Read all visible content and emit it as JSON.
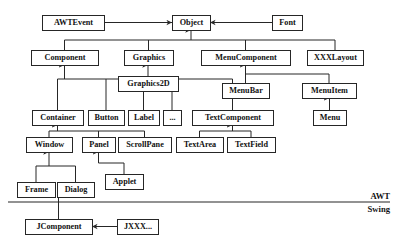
{
  "diagram": {
    "type": "class-hierarchy",
    "width": 396,
    "height": 247,
    "background_color": "#ffffff",
    "line_color": "#262626",
    "text_color": "#111111",
    "nodes": [
      {
        "id": "awtevent",
        "label": "AWTEvent",
        "x": 42,
        "y": 15,
        "w": 62,
        "h": 15,
        "font_size": 8.2
      },
      {
        "id": "object",
        "label": "Object",
        "x": 172,
        "y": 15,
        "w": 38,
        "h": 15,
        "font_size": 8.2
      },
      {
        "id": "font",
        "label": "Font",
        "x": 272,
        "y": 15,
        "w": 30,
        "h": 15,
        "font_size": 8.2
      },
      {
        "id": "component",
        "label": "Component",
        "x": 31,
        "y": 50,
        "w": 67,
        "h": 15,
        "font_size": 8.2
      },
      {
        "id": "graphics",
        "label": "Graphics",
        "x": 124,
        "y": 50,
        "w": 49,
        "h": 15,
        "font_size": 8.2
      },
      {
        "id": "menucomponent",
        "label": "MenuComponent",
        "x": 201,
        "y": 50,
        "w": 89,
        "h": 15,
        "font_size": 8.2
      },
      {
        "id": "xxxlayout",
        "label": "XXXLayout",
        "x": 307,
        "y": 50,
        "w": 56,
        "h": 15,
        "font_size": 8.2
      },
      {
        "id": "graphics2d",
        "label": "Graphics2D",
        "x": 118,
        "y": 76,
        "w": 60,
        "h": 15,
        "font_size": 8.2
      },
      {
        "id": "menubar",
        "label": "MenuBar",
        "x": 222,
        "y": 83,
        "w": 47,
        "h": 15,
        "font_size": 8.2
      },
      {
        "id": "menuitem",
        "label": "MenuItem",
        "x": 302,
        "y": 83,
        "w": 54,
        "h": 15,
        "font_size": 8.2
      },
      {
        "id": "container",
        "label": "Container",
        "x": 32,
        "y": 110,
        "w": 51,
        "h": 15,
        "font_size": 8.2
      },
      {
        "id": "button",
        "label": "Button",
        "x": 88,
        "y": 110,
        "w": 36,
        "h": 15,
        "font_size": 8.2
      },
      {
        "id": "label",
        "label": "Label",
        "x": 128,
        "y": 110,
        "w": 31,
        "h": 15,
        "font_size": 8.2
      },
      {
        "id": "ellipsis",
        "label": "...",
        "x": 163,
        "y": 110,
        "w": 18,
        "h": 15,
        "font_size": 8.2
      },
      {
        "id": "textcomponent",
        "label": "TextComponent",
        "x": 192,
        "y": 110,
        "w": 81,
        "h": 15,
        "font_size": 8.2
      },
      {
        "id": "menu",
        "label": "Menu",
        "x": 313,
        "y": 110,
        "w": 33,
        "h": 15,
        "font_size": 8.2
      },
      {
        "id": "window",
        "label": "Window",
        "x": 26,
        "y": 137,
        "w": 46,
        "h": 15,
        "font_size": 8.2
      },
      {
        "id": "panel",
        "label": "Panel",
        "x": 82,
        "y": 137,
        "w": 33,
        "h": 15,
        "font_size": 8.2
      },
      {
        "id": "scrollpane",
        "label": "ScrollPane",
        "x": 118,
        "y": 137,
        "w": 53,
        "h": 15,
        "font_size": 8.2
      },
      {
        "id": "textarea",
        "label": "TextArea",
        "x": 176,
        "y": 137,
        "w": 47,
        "h": 15,
        "font_size": 8.2
      },
      {
        "id": "textfield",
        "label": "TextField",
        "x": 227,
        "y": 137,
        "w": 48,
        "h": 15,
        "font_size": 8.2
      },
      {
        "id": "applet",
        "label": "Applet",
        "x": 105,
        "y": 174,
        "w": 38,
        "h": 15,
        "font_size": 8.2
      },
      {
        "id": "frame",
        "label": "Frame",
        "x": 17,
        "y": 182,
        "w": 38,
        "h": 15,
        "font_size": 8.2
      },
      {
        "id": "dialog",
        "label": "Dialog",
        "x": 57,
        "y": 182,
        "w": 37,
        "h": 15,
        "font_size": 8.2
      },
      {
        "id": "jcomponent",
        "label": "JComponent",
        "x": 25,
        "y": 219,
        "w": 67,
        "h": 15,
        "font_size": 8.2
      },
      {
        "id": "jxxx",
        "label": "JXXX...",
        "x": 117,
        "y": 219,
        "w": 41,
        "h": 15,
        "font_size": 8.2
      }
    ],
    "edges": [
      {
        "id": "e-awtevent-object",
        "from": "awtevent",
        "to": "object",
        "kind": "horizontal-arrow"
      },
      {
        "id": "e-font-object",
        "from": "font",
        "to": "object",
        "kind": "horizontal-arrow"
      },
      {
        "id": "e-jxxx-jcomponent",
        "from": "jxxx",
        "to": "jcomponent",
        "kind": "horizontal-arrow"
      },
      {
        "id": "e-component-object",
        "from": "component",
        "to": "object",
        "kind": "bus-up"
      },
      {
        "id": "e-graphics-object",
        "from": "graphics",
        "to": "object",
        "kind": "bus-up"
      },
      {
        "id": "e-menucomponent-object",
        "from": "menucomponent",
        "to": "object",
        "kind": "bus-up"
      },
      {
        "id": "e-xxxlayout-object",
        "from": "xxxlayout",
        "to": "object",
        "kind": "bus-up"
      },
      {
        "id": "e-graphics2d-graphics",
        "from": "graphics2d",
        "to": "graphics",
        "kind": "vertical-arrow"
      },
      {
        "id": "e-menubar-menucomponent",
        "from": "menubar",
        "to": "menucomponent",
        "kind": "bus-up"
      },
      {
        "id": "e-menuitem-menucomponent",
        "from": "menuitem",
        "to": "menucomponent",
        "kind": "bus-up"
      },
      {
        "id": "e-menu-menuitem",
        "from": "menu",
        "to": "menuitem",
        "kind": "vertical-arrow"
      },
      {
        "id": "e-container-component",
        "from": "container",
        "to": "component",
        "kind": "bus-up"
      },
      {
        "id": "e-button-component",
        "from": "button",
        "to": "component",
        "kind": "bus-up"
      },
      {
        "id": "e-label-component",
        "from": "label",
        "to": "component",
        "kind": "bus-up"
      },
      {
        "id": "e-ellipsis-component",
        "from": "ellipsis",
        "to": "component",
        "kind": "bus-up"
      },
      {
        "id": "e-textcomponent-component",
        "from": "textcomponent",
        "to": "component",
        "kind": "bus-up"
      },
      {
        "id": "e-window-container",
        "from": "window",
        "to": "container",
        "kind": "bus-up"
      },
      {
        "id": "e-panel-container",
        "from": "panel",
        "to": "container",
        "kind": "bus-up"
      },
      {
        "id": "e-scrollpane-container",
        "from": "scrollpane",
        "to": "container",
        "kind": "bus-up"
      },
      {
        "id": "e-textarea-textcomponent",
        "from": "textarea",
        "to": "textcomponent",
        "kind": "bus-up"
      },
      {
        "id": "e-textfield-textcomponent",
        "from": "textfield",
        "to": "textcomponent",
        "kind": "bus-up"
      },
      {
        "id": "e-frame-window",
        "from": "frame",
        "to": "window",
        "kind": "bus-up"
      },
      {
        "id": "e-dialog-window",
        "from": "dialog",
        "to": "window",
        "kind": "bus-up"
      },
      {
        "id": "e-applet-panel",
        "from": "applet",
        "to": "panel",
        "kind": "bus-up"
      },
      {
        "id": "e-jcomponent-dialog",
        "from": "jcomponent",
        "to": "dialog",
        "kind": "plain-vertical"
      }
    ],
    "divider": {
      "id": "awt-swing-divider",
      "x1": 8,
      "x2": 390,
      "y": 202
    },
    "layer_labels": [
      {
        "id": "awt-label",
        "label": "AWT",
        "x": 390,
        "y": 199,
        "font_size": 8.6
      },
      {
        "id": "swing-label",
        "label": "Swing",
        "x": 390,
        "y": 212,
        "font_size": 8.6
      }
    ]
  }
}
